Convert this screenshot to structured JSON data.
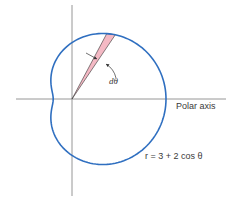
{
  "diagram": {
    "labels": {
      "polar_axis": "Polar axis",
      "equation": "r = 3 + 2 cos θ",
      "dtheta": "dθ"
    },
    "curve": {
      "type": "limaçon",
      "equation": "r = 3 + 2 cos θ",
      "a": 3,
      "b": 2,
      "color": "#2f6fc0"
    },
    "wedge": {
      "fill": "#f4b9c4",
      "stroke": "#333333",
      "description": "area element of angle dθ"
    },
    "axes": {
      "color": "#8a8a8a"
    }
  }
}
